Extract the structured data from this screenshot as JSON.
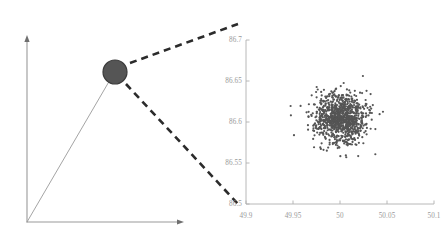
{
  "figure": {
    "background_color": "#ffffff",
    "width": 448,
    "height": 249
  },
  "left_panel": {
    "name": "schematic-axes-panel",
    "axis_color": "#9a9a9a",
    "y_axis": {
      "x": 27,
      "y_top": 37,
      "y_bottom": 222,
      "arrow": "up"
    },
    "x_axis": {
      "y": 222,
      "x_left": 27,
      "x_right": 182,
      "arrow": "right"
    },
    "ray": {
      "x1": 27,
      "y1": 222,
      "x2": 114,
      "y2": 73,
      "color": "#9a9a9a"
    },
    "marker": {
      "label": "highlighted-sample-marker",
      "cx": 115,
      "cy": 72,
      "r": 12,
      "fill": "#555555",
      "stroke": "#3b3b3b"
    },
    "callout_upper": {
      "x1": 130,
      "y1": 63,
      "x2": 238,
      "y2": 24,
      "color": "#2b2b2b",
      "dash": "7,5",
      "width": 2.6
    },
    "callout_lower": {
      "x1": 126,
      "y1": 84,
      "x2": 239,
      "y2": 205,
      "color": "#2b2b2b",
      "dash": "7,5",
      "width": 2.6
    }
  },
  "chart_data": {
    "type": "scatter",
    "title": "",
    "xlabel": "",
    "ylabel": "",
    "xlim": [
      49.9,
      50.1
    ],
    "ylim": [
      86.5,
      86.7
    ],
    "grid": false,
    "legend": null,
    "xticks": [
      "49.9",
      "49.95",
      "50",
      "50.05",
      "50.1"
    ],
    "xtick_values": [
      49.9,
      49.95,
      50,
      50.05,
      50.1
    ],
    "yticks": [
      "86.7",
      "86.65",
      "86.6",
      "86.55",
      "86.5"
    ],
    "ytick_values": [
      86.7,
      86.65,
      86.6,
      86.55,
      86.5
    ],
    "n_points": 1000,
    "marker_color": "#555555",
    "marker_size": 1.1,
    "axis_color": "#b0b0b0",
    "distribution": {
      "kind": "gaussian",
      "mean_x": 50.0,
      "mean_y": 86.6045,
      "std_x": 0.0145,
      "std_y": 0.0145,
      "seed": 20240513
    },
    "plot_box": {
      "left": 246,
      "right": 434,
      "top": 40,
      "bottom": 204
    }
  }
}
